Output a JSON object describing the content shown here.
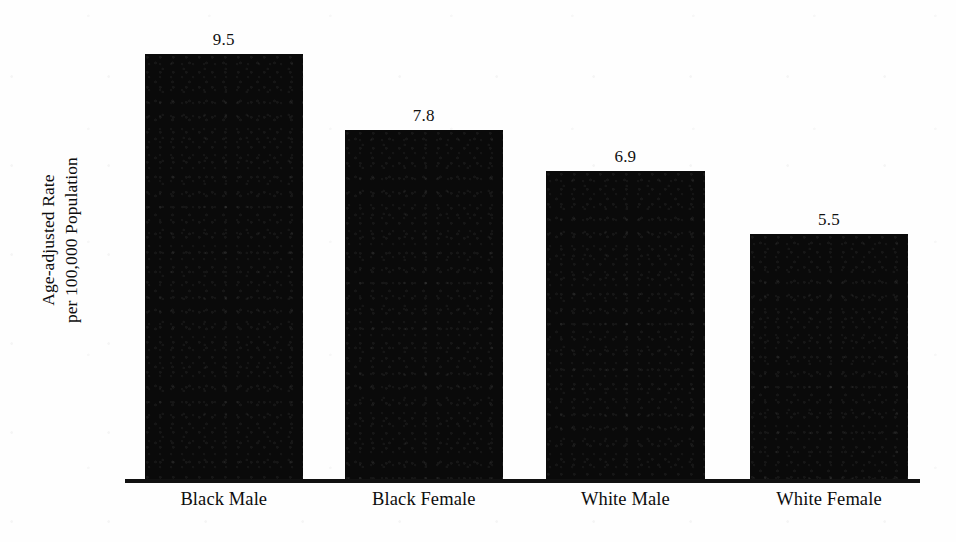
{
  "chart_data": {
    "type": "bar",
    "title": "",
    "subtitle": "",
    "xlabel": "",
    "ylabel": "Age-adjusted Rate per 100,000 Population",
    "ylabel_lines": [
      "Age-adjusted Rate",
      "per 100,000 Population"
    ],
    "categories": [
      "Black Male",
      "Black Female",
      "White Male",
      "White Female"
    ],
    "values": [
      9.5,
      7.8,
      6.9,
      5.5
    ],
    "value_labels": [
      "9.5",
      "7.8",
      "6.9",
      "5.5"
    ],
    "ylim": [
      0,
      10.7
    ],
    "grid": false,
    "legend": null,
    "bar_color": "#0a0a0a",
    "background_color": "#ffffff",
    "axis_color": "#111111",
    "bars": [
      {
        "category": "Black Male",
        "value": 9.5,
        "label": "9.5",
        "left_pct": 2.5,
        "width_pct": 19.7
      },
      {
        "category": "Black Female",
        "value": 7.8,
        "label": "7.8",
        "left_pct": 27.5,
        "width_pct": 19.7
      },
      {
        "category": "White Male",
        "value": 6.9,
        "label": "6.9",
        "left_pct": 52.6,
        "width_pct": 19.9
      },
      {
        "category": "White Female",
        "value": 5.5,
        "label": "5.5",
        "left_pct": 78.1,
        "width_pct": 19.8
      }
    ]
  },
  "axis": {
    "y_title_line1": "Age-adjusted Rate",
    "y_title_line2": "per 100,000 Population"
  }
}
